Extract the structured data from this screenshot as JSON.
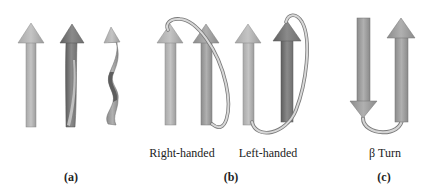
{
  "figure": {
    "panels": [
      {
        "id": "a",
        "letter": "(a)",
        "description": "three beta strands showing increasing twist",
        "strands": [
          "flat",
          "slightly twisted",
          "strongly twisted"
        ]
      },
      {
        "id": "b",
        "letter": "(b)",
        "captions": [
          "Right-handed",
          "Left-handed"
        ],
        "description": "crossover connections between parallel strands"
      },
      {
        "id": "c",
        "letter": "(c)",
        "caption": "β Turn",
        "description": "hairpin connecting antiparallel strands"
      }
    ],
    "colors": {
      "arrow_light": "#b8b8b8",
      "arrow_mid": "#9a9a9a",
      "arrow_dark": "#6e6e6e",
      "connector": "#c8c8c8",
      "connector_edge": "#7a7a7a",
      "text": "#222222"
    }
  }
}
